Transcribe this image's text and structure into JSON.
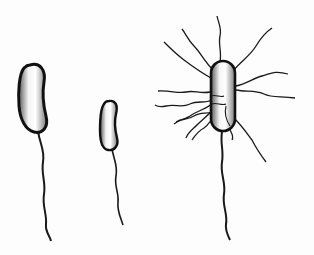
{
  "image": {
    "width": 314,
    "height": 255,
    "background": "#fdfdfd",
    "subject": "Bacterial flagella arrangements illustration",
    "colors": {
      "outline": "#1a1a1a",
      "body_fill_light": "#ffffff",
      "body_fill_dark": "#8a8a8a"
    },
    "organisms": [
      {
        "id": "monotrichous-large",
        "description": "curved rod bacterium with single polar flagellum"
      },
      {
        "id": "monotrichous-small",
        "description": "small curved rod bacterium with single polar flagellum"
      },
      {
        "id": "peritrichous",
        "description": "rod bacterium with flagella all around and a long tail flagellum"
      }
    ]
  }
}
